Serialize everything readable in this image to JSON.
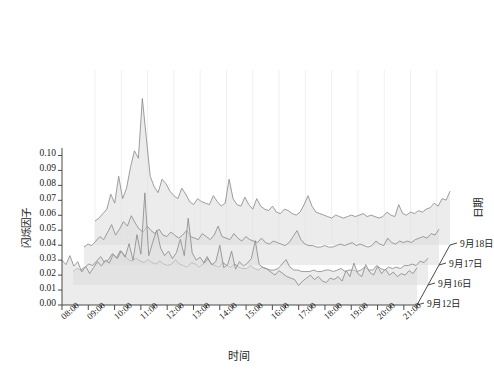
{
  "chart_data": {
    "type": "area",
    "title": "",
    "subtitle": "",
    "xlabel": "时间",
    "ylabel": "闪烁因子",
    "zlabel": "日期",
    "grid": true,
    "legend_position": "none",
    "projection": "3d-waterfall-ridgeline",
    "ylim": [
      0.0,
      0.105
    ],
    "yticks": [
      "0.00",
      "0.01",
      "0.02",
      "0.03",
      "0.04",
      "0.05",
      "0.06",
      "0.07",
      "0.08",
      "0.09",
      "0.10"
    ],
    "ytick_values": [
      0.0,
      0.01,
      0.02,
      0.03,
      0.04,
      0.05,
      0.06,
      0.07,
      0.08,
      0.09,
      0.1
    ],
    "xticks": [
      "08:00",
      "09:00",
      "10:00",
      "11:00",
      "12:00",
      "13:00",
      "14:00",
      "15:00",
      "16:00",
      "17:00",
      "18:00",
      "19:00",
      "20:00",
      "21:00"
    ],
    "xlim": [
      8.0,
      21.5
    ],
    "zticks": [
      "9月12日",
      "9月16日",
      "9月17日",
      "9月18日"
    ],
    "line_color": "#8c8c8c",
    "fill_color": "#dcdcdc",
    "axis_color": "#4a4a4a",
    "grid_color": "#f0f0f0",
    "x": [
      8.0,
      8.15,
      8.3,
      8.45,
      8.6,
      8.75,
      8.9,
      9.05,
      9.2,
      9.35,
      9.5,
      9.65,
      9.8,
      9.95,
      10.1,
      10.25,
      10.4,
      10.55,
      10.7,
      10.85,
      11.0,
      11.15,
      11.3,
      11.45,
      11.6,
      11.75,
      11.9,
      12.05,
      12.2,
      12.35,
      12.5,
      12.65,
      12.8,
      12.95,
      13.1,
      13.25,
      13.4,
      13.55,
      13.7,
      13.85,
      14.0,
      14.15,
      14.3,
      14.45,
      14.6,
      14.75,
      14.9,
      15.05,
      15.2,
      15.35,
      15.5,
      15.65,
      15.8,
      15.95,
      16.1,
      16.25,
      16.4,
      16.55,
      16.7,
      16.85,
      17.0,
      17.15,
      17.3,
      17.45,
      17.6,
      17.75,
      17.9,
      18.05,
      18.2,
      18.35,
      18.5,
      18.65,
      18.8,
      18.95,
      19.1,
      19.25,
      19.4,
      19.55,
      19.7,
      19.85,
      20.0,
      20.15,
      20.3,
      20.45,
      20.6,
      20.75,
      20.9,
      21.05,
      21.2,
      21.35,
      21.5
    ],
    "series": [
      {
        "name": "9月18日",
        "date": "9月18日",
        "z_index": 3,
        "values": [
          0.016,
          0.018,
          0.021,
          0.024,
          0.034,
          0.028,
          0.046,
          0.031,
          0.038,
          0.052,
          0.063,
          0.058,
          0.098,
          0.072,
          0.046,
          0.039,
          0.035,
          0.044,
          0.041,
          0.036,
          0.033,
          0.031,
          0.038,
          0.034,
          0.029,
          0.027,
          0.031,
          0.029,
          0.028,
          0.027,
          0.033,
          0.029,
          0.026,
          0.028,
          0.044,
          0.031,
          0.027,
          0.026,
          0.032,
          0.027,
          0.024,
          0.031,
          0.026,
          0.024,
          0.023,
          0.026,
          0.022,
          0.021,
          0.024,
          0.023,
          0.021,
          0.02,
          0.022,
          0.027,
          0.033,
          0.026,
          0.022,
          0.021,
          0.02,
          0.019,
          0.018,
          0.02,
          0.019,
          0.018,
          0.019,
          0.02,
          0.019,
          0.02,
          0.021,
          0.019,
          0.02,
          0.019,
          0.018,
          0.019,
          0.022,
          0.02,
          0.019,
          0.027,
          0.021,
          0.02,
          0.022,
          0.021,
          0.023,
          0.022,
          0.024,
          0.025,
          0.028,
          0.026,
          0.031,
          0.03,
          0.036
        ]
      },
      {
        "name": "9月17日",
        "date": "9月17日",
        "z_index": 2,
        "values": [
          0.012,
          0.014,
          0.013,
          0.016,
          0.019,
          0.017,
          0.022,
          0.027,
          0.02,
          0.024,
          0.029,
          0.026,
          0.033,
          0.028,
          0.024,
          0.022,
          0.026,
          0.023,
          0.021,
          0.024,
          0.02,
          0.019,
          0.022,
          0.02,
          0.018,
          0.02,
          0.023,
          0.019,
          0.018,
          0.017,
          0.021,
          0.019,
          0.017,
          0.02,
          0.026,
          0.019,
          0.018,
          0.017,
          0.021,
          0.018,
          0.016,
          0.019,
          0.017,
          0.016,
          0.015,
          0.018,
          0.015,
          0.014,
          0.016,
          0.015,
          0.014,
          0.013,
          0.015,
          0.019,
          0.023,
          0.017,
          0.014,
          0.013,
          0.013,
          0.012,
          0.012,
          0.013,
          0.012,
          0.012,
          0.013,
          0.014,
          0.013,
          0.014,
          0.015,
          0.013,
          0.014,
          0.013,
          0.012,
          0.013,
          0.016,
          0.014,
          0.013,
          0.018,
          0.015,
          0.014,
          0.016,
          0.015,
          0.016,
          0.015,
          0.017,
          0.018,
          0.019,
          0.018,
          0.021,
          0.02,
          0.024
        ]
      },
      {
        "name": "9月16日",
        "date": "9月16日",
        "z_index": 1,
        "values": [
          0.009,
          0.011,
          0.01,
          0.012,
          0.014,
          0.013,
          0.016,
          0.019,
          0.015,
          0.017,
          0.021,
          0.018,
          0.023,
          0.02,
          0.017,
          0.016,
          0.018,
          0.016,
          0.015,
          0.017,
          0.015,
          0.014,
          0.016,
          0.014,
          0.013,
          0.014,
          0.017,
          0.014,
          0.013,
          0.012,
          0.015,
          0.014,
          0.012,
          0.014,
          0.019,
          0.014,
          0.013,
          0.012,
          0.015,
          0.013,
          0.012,
          0.014,
          0.012,
          0.011,
          0.011,
          0.013,
          0.011,
          0.01,
          0.012,
          0.011,
          0.01,
          0.01,
          0.011,
          0.014,
          0.017,
          0.012,
          0.01,
          0.01,
          0.009,
          0.009,
          0.009,
          0.01,
          0.009,
          0.009,
          0.01,
          0.01,
          0.009,
          0.01,
          0.011,
          0.009,
          0.01,
          0.01,
          0.009,
          0.01,
          0.012,
          0.01,
          0.01,
          0.013,
          0.011,
          0.01,
          0.012,
          0.011,
          0.012,
          0.011,
          0.013,
          0.013,
          0.014,
          0.013,
          0.016,
          0.015,
          0.018
        ]
      },
      {
        "name": "9月12日",
        "date": "9月12日",
        "z_index": 0,
        "values": [
          0.03,
          0.027,
          0.033,
          0.026,
          0.029,
          0.022,
          0.026,
          0.021,
          0.025,
          0.029,
          0.026,
          0.03,
          0.028,
          0.034,
          0.031,
          0.036,
          0.032,
          0.041,
          0.03,
          0.047,
          0.034,
          0.075,
          0.033,
          0.042,
          0.05,
          0.038,
          0.033,
          0.036,
          0.031,
          0.035,
          0.044,
          0.033,
          0.058,
          0.035,
          0.03,
          0.032,
          0.028,
          0.031,
          0.027,
          0.029,
          0.04,
          0.025,
          0.027,
          0.036,
          0.024,
          0.029,
          0.026,
          0.028,
          0.031,
          0.043,
          0.027,
          0.025,
          0.024,
          0.022,
          0.02,
          0.023,
          0.021,
          0.019,
          0.018,
          0.017,
          0.013,
          0.016,
          0.018,
          0.02,
          0.017,
          0.019,
          0.016,
          0.015,
          0.018,
          0.017,
          0.019,
          0.016,
          0.023,
          0.019,
          0.028,
          0.021,
          0.019,
          0.027,
          0.022,
          0.02,
          0.026,
          0.021,
          0.024,
          0.02,
          0.022,
          0.019,
          0.021,
          0.02,
          0.023,
          0.021,
          0.025
        ]
      }
    ]
  }
}
